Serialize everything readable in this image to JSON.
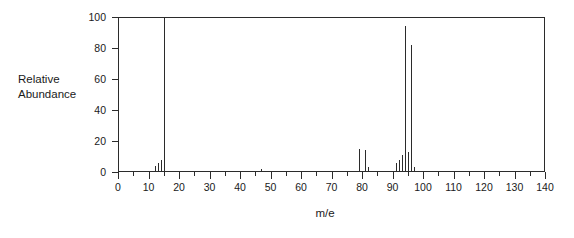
{
  "figure": {
    "background_color": "#ffffff",
    "ink_color": "#2b2b2b"
  },
  "axes": {
    "y_title_line1": "Relative",
    "y_title_line2": "Abundance",
    "x_title": "m/e",
    "y_ticks": [
      0,
      20,
      40,
      60,
      80,
      100
    ],
    "x_ticks_major": [
      0,
      10,
      20,
      30,
      40,
      50,
      60,
      70,
      80,
      90,
      100,
      110,
      120,
      130,
      140
    ],
    "x_ticks_minor": [
      5,
      15,
      25,
      35,
      45,
      55,
      65,
      75,
      85,
      95,
      105,
      115,
      125,
      135
    ]
  },
  "chart_data": {
    "type": "bar",
    "title": "",
    "subtitle": "",
    "xlabel": "m/e",
    "ylabel": "Relative Abundance",
    "xlim": [
      0,
      140
    ],
    "ylim": [
      0,
      100
    ],
    "grid": false,
    "legend": false,
    "categories": [
      12,
      13,
      14,
      15,
      47,
      79,
      81,
      82,
      91,
      92,
      93,
      94,
      95,
      96,
      97
    ],
    "values": [
      4,
      6,
      8,
      100,
      2,
      15,
      14,
      3,
      6,
      8,
      11,
      94,
      13,
      82,
      3
    ],
    "series": [
      {
        "name": "Relative Abundance",
        "points": [
          {
            "mz": 12,
            "intensity": 4
          },
          {
            "mz": 13,
            "intensity": 6
          },
          {
            "mz": 14,
            "intensity": 8
          },
          {
            "mz": 15,
            "intensity": 100
          },
          {
            "mz": 47,
            "intensity": 2
          },
          {
            "mz": 79,
            "intensity": 15
          },
          {
            "mz": 81,
            "intensity": 14
          },
          {
            "mz": 82,
            "intensity": 3
          },
          {
            "mz": 91,
            "intensity": 6
          },
          {
            "mz": 92,
            "intensity": 8
          },
          {
            "mz": 93,
            "intensity": 11
          },
          {
            "mz": 94,
            "intensity": 94
          },
          {
            "mz": 95,
            "intensity": 13
          },
          {
            "mz": 96,
            "intensity": 82
          },
          {
            "mz": 97,
            "intensity": 3
          }
        ]
      }
    ]
  }
}
